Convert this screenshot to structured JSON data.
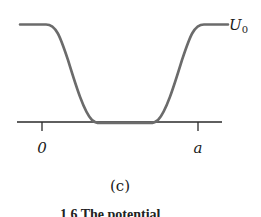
{
  "figure": {
    "panel_label": "(c)",
    "curve_label": "U",
    "curve_label_subscript": "0",
    "x_ticks": [
      {
        "label": "0",
        "x": 42
      },
      {
        "label": "a",
        "x": 198
      }
    ],
    "colors": {
      "curve": "#6b6b6b",
      "axis": "#2a2a2a",
      "text": "#1a1a1a"
    },
    "caption_partial": "1 6  The potential"
  }
}
